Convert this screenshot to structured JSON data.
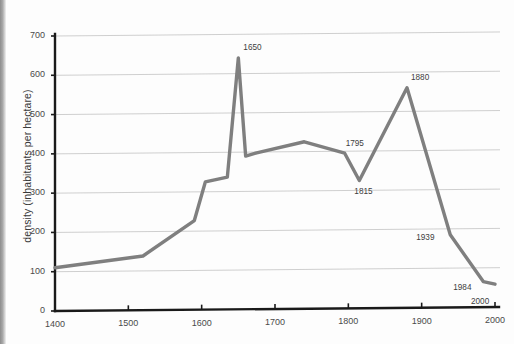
{
  "figure": {
    "background_color": "#fdfdfd",
    "line_color": "#7f7f7f",
    "gridline_color": "#c9c9c9",
    "axis_color": "#1a1a1a",
    "text_color": "#3d3d3d"
  },
  "chart_data": {
    "type": "line",
    "title": "",
    "xlabel": "",
    "ylabel": "density (inhabitants per hectare)",
    "xlim": [
      1400,
      2000
    ],
    "ylim": [
      0,
      700
    ],
    "grid": true,
    "legend": "none",
    "xticks": [
      1400,
      1500,
      1600,
      1700,
      1800,
      1900,
      2000
    ],
    "xtick_labels": [
      "1400",
      "1500",
      "1600",
      "1700",
      "1800",
      "1900",
      "2000"
    ],
    "yticks": [
      0,
      100,
      200,
      300,
      400,
      500,
      600,
      700
    ],
    "ytick_labels": [
      "0",
      "100",
      "200",
      "300",
      "400",
      "500",
      "600",
      "700"
    ],
    "series": [
      {
        "name": "density",
        "x": [
          1400,
          1520,
          1590,
          1605,
          1635,
          1650,
          1660,
          1675,
          1740,
          1795,
          1815,
          1880,
          1939,
          1984,
          2000
        ],
        "y": [
          110,
          138,
          227,
          325,
          337,
          640,
          390,
          398,
          425,
          395,
          325,
          560,
          185,
          65,
          58
        ]
      }
    ],
    "annotations": [
      {
        "label": "1650",
        "x": 1650,
        "y": 640
      },
      {
        "label": "1795",
        "x": 1795,
        "y": 395
      },
      {
        "label": "1815",
        "x": 1815,
        "y": 325
      },
      {
        "label": "1880",
        "x": 1880,
        "y": 560
      },
      {
        "label": "1939",
        "x": 1939,
        "y": 185
      },
      {
        "label": "1984",
        "x": 1984,
        "y": 65
      },
      {
        "label": "2000",
        "x": 2000,
        "y": 58
      }
    ]
  }
}
